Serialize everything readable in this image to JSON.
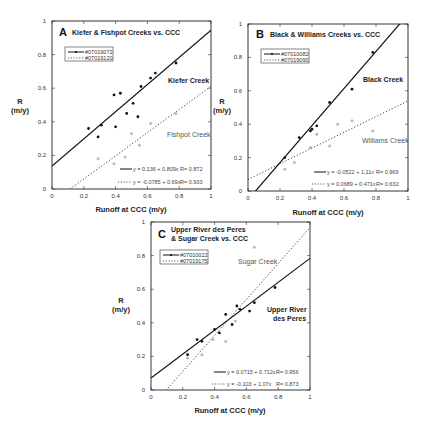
{
  "chart_data": [
    {
      "panel": "A",
      "type": "scatter",
      "title": "Kiefer & Fishpot Creeks vs. CCC",
      "xlabel": "Runoff at CCC (m/y)",
      "ylabel": "R (m/y)",
      "xlim": [
        0,
        1
      ],
      "ylim": [
        0,
        1
      ],
      "xticks": [
        "0",
        "0.2",
        "0.4",
        "0.6",
        "0.8",
        "1"
      ],
      "yticks": [
        "0",
        "0.2",
        "0.4",
        "0.6",
        "0.8",
        "1"
      ],
      "legend": [
        "#07019072",
        "#07019120"
      ],
      "series": [
        {
          "name": "#07019072",
          "label": "Kiefer Creek",
          "style": "solid",
          "color": "#111111",
          "x": [
            0.23,
            0.29,
            0.31,
            0.39,
            0.4,
            0.43,
            0.47,
            0.51,
            0.54,
            0.56,
            0.62,
            0.65,
            0.78
          ],
          "y": [
            0.36,
            0.31,
            0.38,
            0.56,
            0.37,
            0.57,
            0.45,
            0.51,
            0.43,
            0.61,
            0.66,
            0.69,
            0.75
          ],
          "fit": {
            "intercept": 0.136,
            "slope": 0.809,
            "equation": "y = 0.136 + 0.809x",
            "r": "R= 0.872"
          }
        },
        {
          "name": "#07019120",
          "label": "Fishpot Creek",
          "style": "dotted",
          "color": "#bbbbbb",
          "x": [
            0.29,
            0.39,
            0.46,
            0.5,
            0.55,
            0.62,
            0.78
          ],
          "y": [
            0.18,
            0.15,
            0.19,
            0.33,
            0.26,
            0.39,
            0.45
          ],
          "fit": {
            "intercept": -0.0785,
            "slope": 0.69,
            "equation": "y = -0.0785 + 0.69x",
            "r": "R= 0.933"
          }
        }
      ]
    },
    {
      "panel": "B",
      "type": "scatter",
      "title": "Black & Williams Creeks vs. CCC",
      "xlabel": "Runoff at CCC (m/y)",
      "ylabel": "R (m/y)",
      "xlim": [
        0,
        1
      ],
      "ylim": [
        0,
        1
      ],
      "xticks": [
        "0",
        "0.2",
        "0.4",
        "0.6",
        "0.8",
        "1"
      ],
      "yticks": [
        "0",
        "0.2",
        "0.4",
        "0.6",
        "0.8",
        "1"
      ],
      "legend": [
        "#07010082",
        "#07019090"
      ],
      "series": [
        {
          "name": "#07010082",
          "label": "Black Creek",
          "style": "solid",
          "color": "#111111",
          "x": [
            0.23,
            0.32,
            0.39,
            0.4,
            0.43,
            0.51,
            0.65,
            0.78
          ],
          "y": [
            0.2,
            0.32,
            0.36,
            0.37,
            0.39,
            0.53,
            0.61,
            0.83
          ],
          "fit": {
            "intercept": -0.0522,
            "slope": 1.11,
            "equation": "y = -0.0522 + 1.11x",
            "r": "R= 0.969"
          }
        },
        {
          "name": "#07019090",
          "label": "Williams Creek",
          "style": "dotted",
          "color": "#bbbbbb",
          "x": [
            0.23,
            0.29,
            0.39,
            0.43,
            0.51,
            0.56,
            0.65,
            0.78
          ],
          "y": [
            0.13,
            0.17,
            0.26,
            0.34,
            0.27,
            0.4,
            0.42,
            0.36
          ],
          "fit": {
            "intercept": 0.0689,
            "slope": 0.471,
            "equation": "y = 0.0689 + 0.471x",
            "r": "R= 0.632"
          }
        }
      ]
    },
    {
      "panel": "C",
      "type": "scatter",
      "title": "Upper River des Peres & Sugar Creek vs. CCC",
      "xlabel": "Runoff at CCC (m/y)",
      "ylabel": "R (m/y)",
      "xlim": [
        0,
        1
      ],
      "ylim": [
        0,
        1
      ],
      "xticks": [
        "0",
        "0.2",
        "0.4",
        "0.6",
        "0.8",
        "1"
      ],
      "yticks": [
        "0",
        "0.2",
        "0.4",
        "0.6",
        "0.8",
        "1"
      ],
      "legend": [
        "#07010022",
        "#07019175"
      ],
      "series": [
        {
          "name": "#07010022",
          "label": "Upper River des Peres",
          "style": "solid",
          "color": "#111111",
          "x": [
            0.23,
            0.29,
            0.32,
            0.4,
            0.43,
            0.47,
            0.51,
            0.54,
            0.56,
            0.62,
            0.65,
            0.78
          ],
          "y": [
            0.21,
            0.3,
            0.29,
            0.36,
            0.34,
            0.45,
            0.39,
            0.5,
            0.48,
            0.47,
            0.52,
            0.61
          ],
          "fit": {
            "intercept": 0.0715,
            "slope": 0.712,
            "equation": "y = 0.0715 + 0.712x",
            "r": "R= 0.956"
          }
        },
        {
          "name": "#07019175",
          "label": "Sugar Creek",
          "style": "dotted",
          "color": "#bbbbbb",
          "x": [
            0.23,
            0.32,
            0.39,
            0.47,
            0.53,
            0.65
          ],
          "y": [
            0.19,
            0.21,
            0.3,
            0.29,
            0.41,
            0.85
          ],
          "fit": {
            "intercept": -0.103,
            "slope": 1.07,
            "equation": "y = -0.103 + 1.07x",
            "r": "R= 0.873"
          }
        }
      ]
    }
  ],
  "panels": {
    "a": {
      "letter": "A",
      "title": "Kiefer & Fishpot Creeks vs. CCC",
      "leg1": "#07019072",
      "leg2": "#07019120",
      "label1": "Kiefer Creek",
      "label2": "Fishpot Creek",
      "eq1": "y = 0.136 + 0.809x",
      "r1": "R= 0.872",
      "eq2": "y = -0.0785 + 0.69x",
      "r2": "R= 0.933"
    },
    "b": {
      "letter": "B",
      "title": "Black & Williams Creeks vs. CCC",
      "leg1": "#07010082",
      "leg2": "#07019090",
      "label1": "Black Creek",
      "label2": "Williams Creek",
      "eq1": "y = -0.0522 + 1.11x",
      "r1": "R= 0.969",
      "eq2": "y = 0.0689 + 0.471x",
      "r2": "R= 0.632"
    },
    "c": {
      "letter": "C",
      "title1": "Upper River des Peres",
      "title2": "& Sugar Creek vs. CCC",
      "leg1": "#07010022",
      "leg2": "#07019175",
      "label1a": "Upper River",
      "label1b": "des Peres",
      "label2": "Sugar Creek",
      "eq1": "y = 0.0715 + 0.712x",
      "r1": "R= 0.956",
      "eq2": "y = -0.103 + 1.07x",
      "r2": "R= 0.873"
    }
  },
  "axes": {
    "xlabel": "Runoff at CCC (m/y)",
    "ylabel_1": "R",
    "ylabel_2": "(m/y)",
    "ticks": [
      "0",
      "0.2",
      "0.4",
      "0.6",
      "0.8",
      "1"
    ]
  }
}
